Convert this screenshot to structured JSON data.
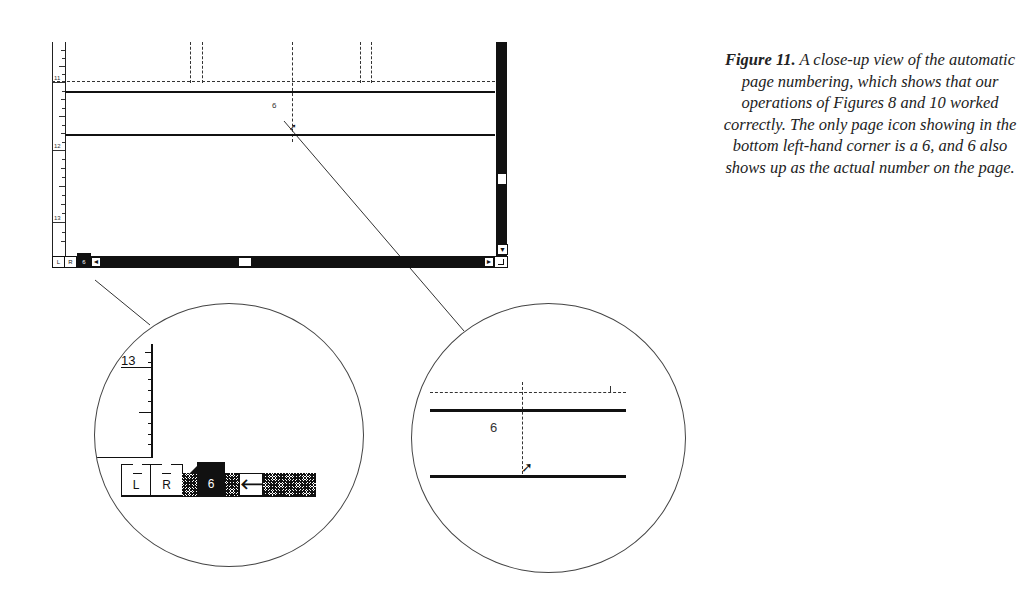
{
  "window": {
    "ruler_labels": [
      "11",
      "12",
      "13"
    ],
    "page_number_on_page": "6",
    "page_icons": {
      "left_label": "L",
      "right_label": "R",
      "current_page": "6"
    },
    "icons": {
      "scroll_left": "◄",
      "scroll_right": "►",
      "scroll_down": "▼"
    }
  },
  "magnifier_left": {
    "ruler_label": "13",
    "page_icon_left": "L",
    "page_icon_right": "R",
    "current_page_icon": "6",
    "arrow_icon": "🡐"
  },
  "magnifier_right": {
    "page_number": "6",
    "cursor_icon": "➚"
  },
  "caption": {
    "label": "Figure 11.",
    "text": " A close-up view of the automatic page numbering, which shows that our operations of Figures 8 and 10 worked correctly. The only page icon showing in the bottom left-hand corner is a 6, and 6 also shows up as the actual number on the page."
  }
}
